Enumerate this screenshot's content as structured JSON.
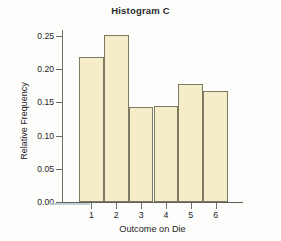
{
  "chart_data": {
    "type": "bar",
    "title": "Histogram C",
    "xlabel": "Outcome on Die",
    "ylabel": "Relative Frequency",
    "categories": [
      "1",
      "2",
      "3",
      "4",
      "5",
      "6"
    ],
    "values": [
      0.218,
      0.252,
      0.143,
      0.144,
      0.177,
      0.167
    ],
    "ylim": [
      0.0,
      0.25
    ],
    "yticks": [
      0.0,
      0.05,
      0.1,
      0.15,
      0.2,
      0.25
    ],
    "ytick_labels": [
      "0.00",
      "0.05",
      "0.10",
      "0.15",
      "0.20",
      "0.25"
    ],
    "xtick_labels": [
      "1",
      "2",
      "3",
      "4",
      "5",
      "6"
    ],
    "grid": false,
    "legend": null,
    "bar_fill_color": "#F5EDC8",
    "bar_edge_color": "#7D7A63",
    "axis_color": "#6D6D63",
    "text_color": "#232323",
    "background_color": "#FDFDFB"
  }
}
